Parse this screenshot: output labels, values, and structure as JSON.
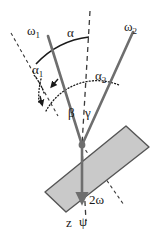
{
  "figure": {
    "background_color": "#ffffff",
    "width": 158,
    "height": 231
  },
  "colors": {
    "ray_gray": "#6e6e6e",
    "slab_fill": "#c9c9c9",
    "slab_border": "#555555",
    "line_black": "#1a1a1a"
  },
  "labels": {
    "omega1": "ω1",
    "omega2": "ω2",
    "alpha": "α",
    "alpha1": "α1",
    "alpha2": "α2",
    "beta": "β",
    "gamma": "γ",
    "two_omega": "2ω",
    "z": "z",
    "psi": "ψ"
  },
  "label_parts": {
    "omega_base": "ω",
    "omega1_sub": "1",
    "omega2_sub": "2",
    "alpha_base": "α",
    "alpha1_sub": "1",
    "alpha2_sub": "2",
    "two": "2"
  },
  "geometry": {
    "vertex": {
      "x": 82,
      "y": 145
    },
    "rays": [
      {
        "name": "omega1-ray",
        "from": {
          "x": 48,
          "y": 36
        },
        "to": {
          "x": 82,
          "y": 145
        }
      },
      {
        "name": "omega2-ray",
        "from": {
          "x": 133,
          "y": 32
        },
        "to": {
          "x": 82,
          "y": 145
        }
      },
      {
        "name": "z-ray",
        "from": {
          "x": 82,
          "y": 145
        },
        "to": {
          "x": 82,
          "y": 208
        }
      }
    ],
    "dashed_axis": {
      "from": {
        "x": 90,
        "y": 12
      },
      "to": {
        "x": 82,
        "y": 145
      }
    },
    "dashed_axis_lower": {
      "from": {
        "x": 82,
        "y": 145
      },
      "to": {
        "x": 86,
        "y": 222
      }
    },
    "aux_dashed_upper_left": {
      "from": {
        "x": 11,
        "y": 33
      },
      "to": {
        "x": 55,
        "y": 110
      }
    },
    "aux_dashed_normal": {
      "from": {
        "x": 82,
        "y": 145
      },
      "to": {
        "x": 120,
        "y": 200
      }
    },
    "slab": {
      "points": "45,192 126,126 149,147 66,212"
    },
    "arcs": {
      "alpha": {
        "label_pos": {
          "x": 72,
          "y": 33
        }
      },
      "alpha1": {
        "label_pos": {
          "x": 37,
          "y": 70
        }
      },
      "alpha2": {
        "label_pos": {
          "x": 99,
          "y": 77
        }
      },
      "beta": {
        "label_pos": {
          "x": 72,
          "y": 112
        }
      },
      "gamma": {
        "label_pos": {
          "x": 88,
          "y": 112
        }
      }
    }
  },
  "annotations": {
    "omega1_pos": {
      "x": 31,
      "y": 31
    },
    "omega2_pos": {
      "x": 128,
      "y": 28
    },
    "two_omega_pos": {
      "x": 92,
      "y": 202
    },
    "z_pos": {
      "x": 70,
      "y": 225
    },
    "psi_pos": {
      "x": 85,
      "y": 224
    }
  }
}
